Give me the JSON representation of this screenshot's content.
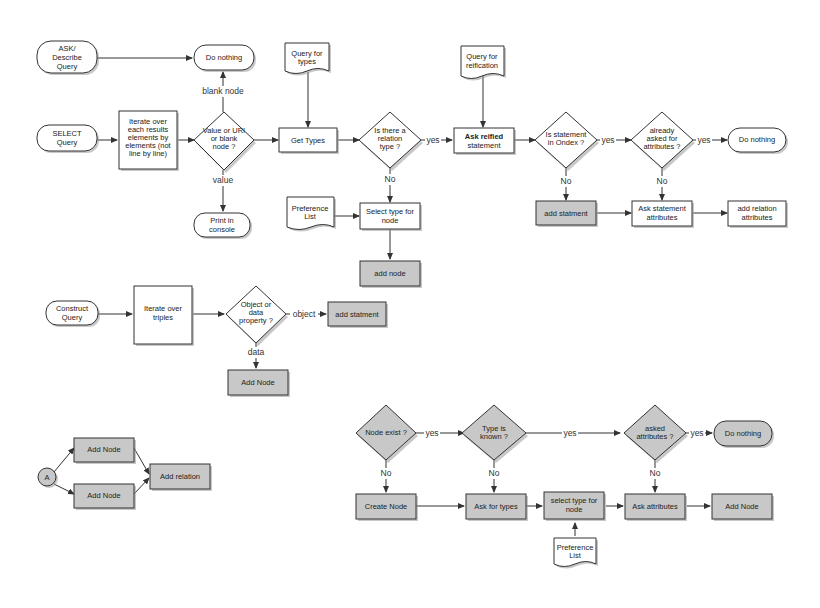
{
  "diagram": {
    "colors": {
      "background": "#ffffff",
      "box_fill": "#ffffff",
      "shaded_fill": "#c8c8c8",
      "stroke": "#333333"
    },
    "flow_select": {
      "ask_query": [
        "ASK/",
        "Describe",
        "Query"
      ],
      "do_nothing_top": "Do nothing",
      "select_query": [
        "SELECT",
        "Query"
      ],
      "iterate_results": [
        "Iterate over",
        "each results",
        "elements by",
        "elements (not",
        "line by line)"
      ],
      "value_decision": [
        "Value or URI",
        "or blank",
        "node ?"
      ],
      "blank_node_label": "blank node",
      "value_label": "value",
      "print_console": [
        "Print in",
        "console"
      ],
      "query_types": [
        "Query for",
        "types"
      ],
      "get_types": "Get Types",
      "relation_decision": [
        "Is there a",
        "relation",
        "type ?"
      ],
      "yes1": "yes",
      "no1": "No",
      "preference_list": [
        "Preference",
        "List"
      ],
      "select_type": [
        "Select type for",
        "node"
      ],
      "add_node": "add node",
      "query_reification": [
        "Query for",
        "reification"
      ],
      "ask_reified": [
        "Ask reified",
        "statement"
      ],
      "in_ondex_decision": [
        "Is statement",
        "in Ondex ?"
      ],
      "yes2": "yes",
      "no2": "No",
      "add_statment": "add statment",
      "already_asked_decision": [
        "already",
        "asked for",
        "attributes ?"
      ],
      "yes3": "yes",
      "no3": "No",
      "do_nothing_right": "Do nothing",
      "ask_statement_attributes": [
        "Ask statement",
        "attributes"
      ],
      "add_relation_attributes": [
        "add relation",
        "attributes"
      ]
    },
    "flow_construct": {
      "construct_query": [
        "Construct",
        "Query"
      ],
      "iterate_triples": [
        "Iterate over",
        "triples"
      ],
      "object_decision": [
        "Object or",
        "data",
        "property ?"
      ],
      "object_label": "object",
      "data_label": "data",
      "add_statment": "add statment",
      "add_node": "Add Node"
    },
    "flow_a": {
      "connector": "A",
      "add_node_top": "Add Node",
      "add_node_bottom": "Add Node",
      "add_relation": "Add relation"
    },
    "flow_node": {
      "node_exist_decision": "Node exist ?",
      "yes1": "yes",
      "type_known_decision": [
        "Type is",
        "known ?"
      ],
      "yes2": "yes",
      "asked_attributes_decision": [
        "asked",
        "attributes ?"
      ],
      "yes3": "yes",
      "do_nothing": "Do nothing",
      "no1": "No",
      "no2": "No",
      "no3": "No",
      "create_node": "Create Node",
      "ask_types": "Ask for types",
      "select_type": [
        "select type for",
        "node"
      ],
      "ask_attributes": "Ask attributes",
      "add_node": "Add Node",
      "preference_list": [
        "Preference",
        "List"
      ]
    }
  }
}
